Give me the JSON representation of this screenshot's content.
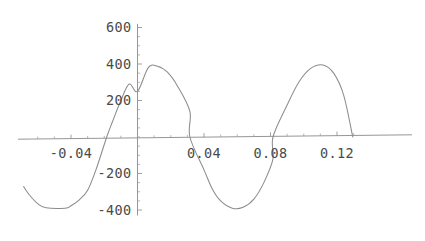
{
  "chart_data": {
    "type": "line",
    "title": "",
    "xlabel": "",
    "ylabel": "",
    "xlim": [
      -0.075,
      0.138
    ],
    "ylim": [
      -430,
      620
    ],
    "grid": false,
    "legend": false,
    "x_ticks": [
      -0.04,
      0.04,
      0.08,
      0.12
    ],
    "x_tick_labels": [
      "-0.04",
      "0.04",
      "0.08",
      "0.12"
    ],
    "y_ticks": [
      -400,
      -200,
      200,
      400,
      600
    ],
    "y_tick_labels": [
      "-400",
      "-200",
      "200",
      "400",
      "600"
    ],
    "x_minor_tick_step": 0.01,
    "y_minor_tick_step": 50,
    "series": [
      {
        "name": "waveform",
        "description": "sinusoid, amplitude 390, period 0.1, zero-crossing rising at x=-0.0185",
        "amplitude": 390,
        "period": 0.1,
        "phase_zero_crossing": -0.0185,
        "x_start": -0.0685,
        "x_end": 0.1295,
        "points": [
          {
            "x": -0.0685,
            "y": -272
          },
          {
            "x": -0.065,
            "y": -318
          },
          {
            "x": -0.06,
            "y": -365
          },
          {
            "x": -0.055,
            "y": -388
          },
          {
            "x": -0.0435,
            "y": -390
          },
          {
            "x": -0.04,
            "y": -377
          },
          {
            "x": -0.035,
            "y": -344
          },
          {
            "x": -0.03,
            "y": -292
          },
          {
            "x": -0.025,
            "y": -180
          },
          {
            "x": -0.0185,
            "y": 0
          },
          {
            "x": -0.015,
            "y": 85
          },
          {
            "x": -0.01,
            "y": 200
          },
          {
            "x": -0.005,
            "y": 290
          },
          {
            "x": 0.0,
            "y": 250
          },
          {
            "x": 0.0065,
            "y": 380
          },
          {
            "x": 0.012,
            "y": 388
          },
          {
            "x": 0.018,
            "y": 355
          },
          {
            "x": 0.024,
            "y": 280
          },
          {
            "x": 0.0315,
            "y": 140
          },
          {
            "x": 0.0315,
            "y": 0
          },
          {
            "x": 0.04,
            "y": -180
          },
          {
            "x": 0.045,
            "y": -285
          },
          {
            "x": 0.05,
            "y": -350
          },
          {
            "x": 0.057,
            "y": -390
          },
          {
            "x": 0.0635,
            "y": -385
          },
          {
            "x": 0.07,
            "y": -340
          },
          {
            "x": 0.076,
            "y": -250
          },
          {
            "x": 0.0815,
            "y": -120
          },
          {
            "x": 0.0815,
            "y": 0
          },
          {
            "x": 0.09,
            "y": 175
          },
          {
            "x": 0.097,
            "y": 300
          },
          {
            "x": 0.104,
            "y": 375
          },
          {
            "x": 0.1115,
            "y": 395
          },
          {
            "x": 0.118,
            "y": 350
          },
          {
            "x": 0.124,
            "y": 230
          },
          {
            "x": 0.1295,
            "y": 0
          }
        ]
      }
    ]
  }
}
